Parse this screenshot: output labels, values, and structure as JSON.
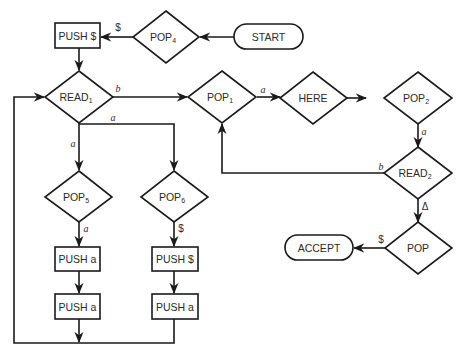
{
  "diagram": {
    "type": "flowchart",
    "nodes": {
      "start": {
        "label": "START",
        "shape": "terminal"
      },
      "pop4": {
        "label": "POP",
        "sub": "4",
        "shape": "diamond"
      },
      "push_dollar_top": {
        "label": "PUSH $",
        "shape": "box"
      },
      "read1": {
        "label": "READ",
        "sub": "1",
        "shape": "diamond"
      },
      "pop1": {
        "label": "POP",
        "sub": "1",
        "shape": "diamond"
      },
      "here": {
        "label": "HERE",
        "shape": "diamond"
      },
      "pop2": {
        "label": "POP",
        "sub": "2",
        "shape": "diamond"
      },
      "read2": {
        "label": "READ",
        "sub": "2",
        "shape": "diamond"
      },
      "pop": {
        "label": "POP",
        "shape": "diamond"
      },
      "accept": {
        "label": "ACCEPT",
        "shape": "terminal"
      },
      "pop5": {
        "label": "POP",
        "sub": "5",
        "shape": "diamond"
      },
      "pop6": {
        "label": "POP",
        "sub": "6",
        "shape": "diamond"
      },
      "push_a_1": {
        "label": "PUSH a",
        "shape": "box"
      },
      "push_a_2": {
        "label": "PUSH a",
        "shape": "box"
      },
      "push_dollar_mid": {
        "label": "PUSH $",
        "shape": "box"
      },
      "push_a_3": {
        "label": "PUSH a",
        "shape": "box"
      }
    },
    "edges": {
      "start_pop4": "",
      "pop4_push": "$",
      "read1_pop1": "b",
      "read1_branch_a_right": "a",
      "read1_pop5": "a",
      "pop1_here": "a",
      "pop2_read2": "a",
      "read2_pop1": "b",
      "read2_pop": "Δ",
      "pop_accept": "$",
      "pop5_push": "a",
      "pop6_push": "$"
    }
  }
}
